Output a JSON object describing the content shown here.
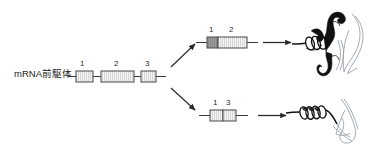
{
  "figure": {
    "width": 382,
    "height": 157,
    "background": "#ffffff",
    "title": ""
  },
  "precursor": {
    "label": "mRNA前駆体",
    "exons": [
      {
        "number": "1",
        "x": 76,
        "y": 71,
        "width": 17,
        "height": 11,
        "fill": "#f2f2f2"
      },
      {
        "number": "2",
        "x": 101,
        "y": 71,
        "width": 33,
        "height": 11,
        "fill": "#f2f2f2"
      },
      {
        "number": "3",
        "x": 141,
        "y": 71,
        "width": 15,
        "height": 11,
        "fill": "#f2f2f2"
      }
    ],
    "line": {
      "x1": 68,
      "x2": 166,
      "y": 76.5
    }
  },
  "branches": {
    "upper_arrow": {
      "x1": 170,
      "y1": 66,
      "x2": 196,
      "y2": 41,
      "label": ""
    },
    "lower_arrow": {
      "x1": 170,
      "y1": 88,
      "x2": 196,
      "y2": 112,
      "label": ""
    }
  },
  "mature_upper": {
    "exons": [
      {
        "number": "1",
        "x": 207,
        "y": 37,
        "width": 11,
        "height": 11,
        "fill": "#a8a8a8"
      },
      {
        "number": "2",
        "x": 218,
        "y": 37,
        "width": 29,
        "height": 11,
        "fill": "#e6e6e6"
      }
    ],
    "line": {
      "x1": 196,
      "x2": 258,
      "y": 42.5
    },
    "translate_arrow": {
      "x1": 263,
      "y": 42.5,
      "x2": 292
    }
  },
  "mature_lower": {
    "exons": [
      {
        "number": "1",
        "x": 210,
        "y": 110,
        "width": 13,
        "height": 11,
        "fill": "#e8e8e8"
      },
      {
        "number": "3",
        "x": 223,
        "y": 110,
        "width": 13,
        "height": 11,
        "fill": "#e8e8e8"
      }
    ],
    "line": {
      "x1": 199,
      "x2": 248,
      "y": 115.5
    },
    "translate_arrow": {
      "x1": 258,
      "y": 115.5,
      "x2": 287
    }
  },
  "proteins": {
    "upper": {
      "name": "protein-product-long",
      "x": 296,
      "y": 8
    },
    "lower": {
      "name": "protein-product-short",
      "x": 294,
      "y": 93
    }
  },
  "colors": {
    "stroke": "#3a3a3a",
    "exon_outline": "#4a4a4a",
    "hatch": "#b5b5b5",
    "text": "#1a1a1a",
    "protein_ink": "#111111",
    "protein_light": "#9aa2ad"
  }
}
